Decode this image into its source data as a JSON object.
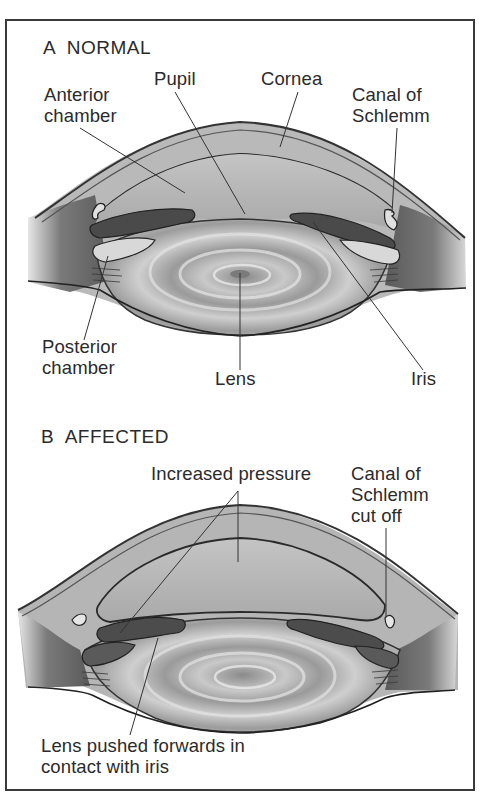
{
  "panels": [
    {
      "id": "A",
      "heading": "A  NORMAL",
      "labels": {
        "pupil": "Pupil",
        "cornea": "Cornea",
        "anterior_chamber": "Anterior\nchamber",
        "canal_of_schlemm": "Canal of\nSchlemm",
        "posterior_chamber": "Posterior\nchamber",
        "lens": "Lens",
        "iris": "Iris"
      }
    },
    {
      "id": "B",
      "heading": "B  AFFECTED",
      "labels": {
        "increased_pressure": "Increased pressure",
        "canal_cut_off": "Canal of\nSchlemm\ncut off",
        "lens_pushed": "Lens pushed forwards in\ncontact with iris"
      }
    }
  ],
  "colors": {
    "ink": "#2b2b2b",
    "tissue": "#a8a8a8",
    "tissue_dark": "#4a4a4a",
    "iris": "#555555",
    "background": "#ffffff"
  }
}
